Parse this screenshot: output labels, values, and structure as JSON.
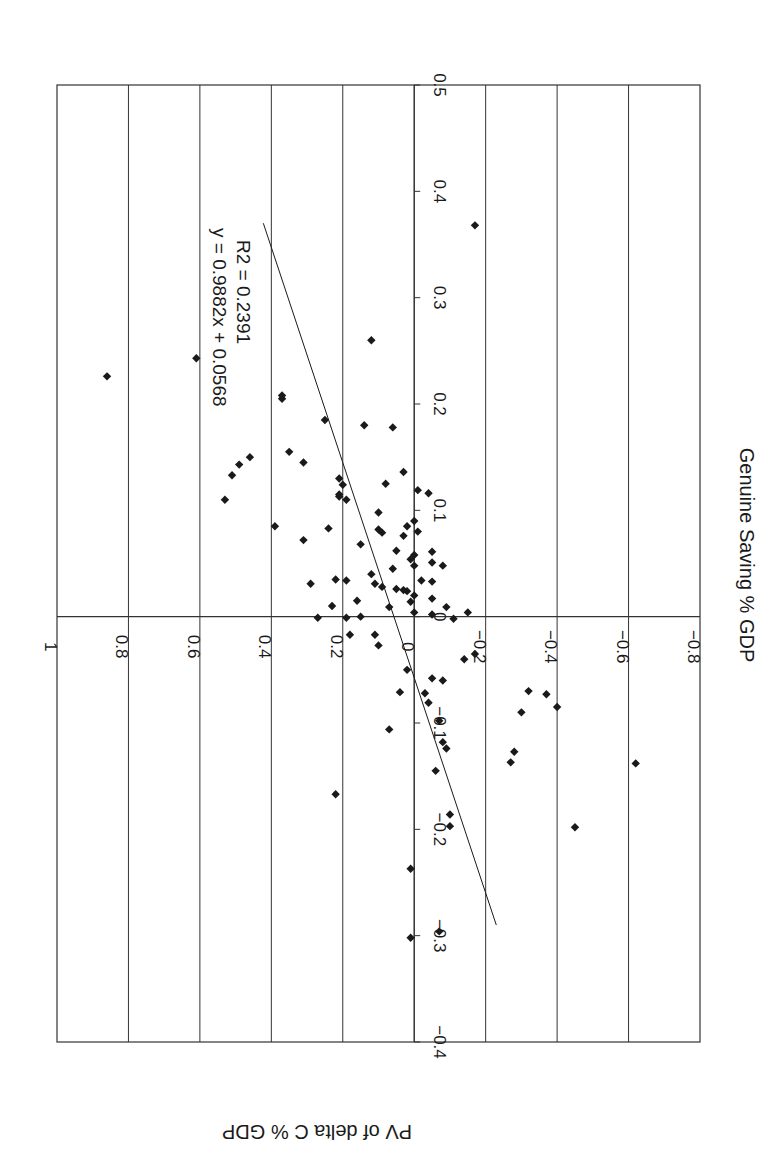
{
  "chart_data": {
    "type": "scatter",
    "orientation_note": "rotated 90 degrees clockwise on page",
    "title": "",
    "xlabel": "Genuine Saving % GDP",
    "ylabel": "PV of delta C % GDP",
    "xlim": [
      -0.4,
      0.5
    ],
    "ylim": [
      -0.8,
      1.0
    ],
    "x_ticks": [
      "-0.4",
      "-0.3",
      "-0.2",
      "-0.1",
      "0",
      "0.1",
      "0.2",
      "0.3",
      "0.4",
      "0.5"
    ],
    "y_ticks": [
      "-0.8",
      "-0.6",
      "-0.4",
      "-0.2",
      "0",
      "0.2",
      "0.4",
      "0.6",
      "0.8",
      "1"
    ],
    "grid": {
      "horizontal": true,
      "vertical": false
    },
    "legend": null,
    "trendline": {
      "equation": "y = 0.9882x + 0.0568",
      "r_squared": "R2 = 0.2391",
      "slope": 0.9882,
      "intercept": 0.0568,
      "x_range": [
        -0.29,
        0.37
      ]
    },
    "series": [
      {
        "name": "Countries",
        "marker": "diamond",
        "points": [
          [
            0.226,
            0.86
          ],
          [
            0.243,
            0.61
          ],
          [
            0.205,
            0.37
          ],
          [
            0.368,
            -0.17
          ],
          [
            0.26,
            0.12
          ],
          [
            0.18,
            0.14
          ],
          [
            0.15,
            0.46
          ],
          [
            0.143,
            0.49
          ],
          [
            0.133,
            0.51
          ],
          [
            0.11,
            0.53
          ],
          [
            0.085,
            0.39
          ],
          [
            0.208,
            0.37
          ],
          [
            0.185,
            0.25
          ],
          [
            0.155,
            0.35
          ],
          [
            0.145,
            0.31
          ],
          [
            0.178,
            0.06
          ],
          [
            0.13,
            0.21
          ],
          [
            0.124,
            0.2
          ],
          [
            0.115,
            0.21
          ],
          [
            0.11,
            0.19
          ],
          [
            0.136,
            0.03
          ],
          [
            0.125,
            0.08
          ],
          [
            0.113,
            0.21
          ],
          [
            0.098,
            0.1
          ],
          [
            0.09,
            0.0
          ],
          [
            0.085,
            0.02
          ],
          [
            0.076,
            0.03
          ],
          [
            0.079,
            0.09
          ],
          [
            0.082,
            0.1
          ],
          [
            0.083,
            0.24
          ],
          [
            0.072,
            0.31
          ],
          [
            0.068,
            0.15
          ],
          [
            0.062,
            0.05
          ],
          [
            0.058,
            0.0
          ],
          [
            0.054,
            0.01
          ],
          [
            0.048,
            0.0
          ],
          [
            0.045,
            0.06
          ],
          [
            0.04,
            0.12
          ],
          [
            0.035,
            0.22
          ],
          [
            0.034,
            0.19
          ],
          [
            0.031,
            0.11
          ],
          [
            0.026,
            0.05
          ],
          [
            0.025,
            0.03
          ],
          [
            0.024,
            0.02
          ],
          [
            0.028,
            0.09
          ],
          [
            0.031,
            0.29
          ],
          [
            0.02,
            0.0
          ],
          [
            0.015,
            0.16
          ],
          [
            0.01,
            0.23
          ],
          [
            0.009,
            0.07
          ],
          [
            0.004,
            0.0
          ],
          [
            0.002,
            -0.05
          ],
          [
            -0.001,
            0.19
          ],
          [
            -0.001,
            0.27
          ],
          [
            0.0,
            0.15
          ],
          [
            -0.002,
            -0.11
          ],
          [
            0.116,
            -0.04
          ],
          [
            0.119,
            -0.01
          ],
          [
            0.08,
            -0.01
          ],
          [
            0.061,
            -0.05
          ],
          [
            0.051,
            -0.05
          ],
          [
            0.048,
            -0.08
          ],
          [
            0.034,
            -0.02
          ],
          [
            0.033,
            -0.05
          ],
          [
            0.017,
            -0.05
          ],
          [
            0.014,
            0.01
          ],
          [
            0.009,
            -0.09
          ],
          [
            0.004,
            -0.15
          ],
          [
            -0.017,
            0.18
          ],
          [
            -0.017,
            0.11
          ],
          [
            -0.027,
            0.1
          ],
          [
            -0.035,
            -0.17
          ],
          [
            -0.04,
            -0.14
          ],
          [
            -0.05,
            0.02
          ],
          [
            -0.058,
            -0.05
          ],
          [
            -0.06,
            -0.08
          ],
          [
            -0.071,
            0.04
          ],
          [
            -0.072,
            -0.03
          ],
          [
            -0.081,
            -0.04
          ],
          [
            -0.09,
            -0.3
          ],
          [
            -0.073,
            -0.37
          ],
          [
            -0.07,
            -0.32
          ],
          [
            -0.085,
            -0.4
          ],
          [
            -0.098,
            -0.07
          ],
          [
            -0.106,
            0.07
          ],
          [
            -0.118,
            -0.08
          ],
          [
            -0.124,
            -0.09
          ],
          [
            -0.127,
            -0.28
          ],
          [
            -0.137,
            -0.27
          ],
          [
            -0.145,
            -0.06
          ],
          [
            -0.167,
            0.22
          ],
          [
            -0.138,
            -0.62
          ],
          [
            -0.186,
            -0.1
          ],
          [
            -0.197,
            -0.1
          ],
          [
            -0.198,
            -0.45
          ],
          [
            -0.237,
            0.01
          ],
          [
            -0.296,
            -0.07
          ],
          [
            -0.302,
            0.01
          ]
        ]
      }
    ]
  },
  "labels": {
    "x_axis_title": "Genuine Saving % GDP",
    "y_axis_title": "PV of delta C % GDP",
    "trend_equation": "y = 0.9882x + 0.0568",
    "trend_r2": "R2 = 0.2391"
  },
  "colors": {
    "ink": "#1a1a1a",
    "grid": "#333333",
    "background": "#ffffff"
  }
}
